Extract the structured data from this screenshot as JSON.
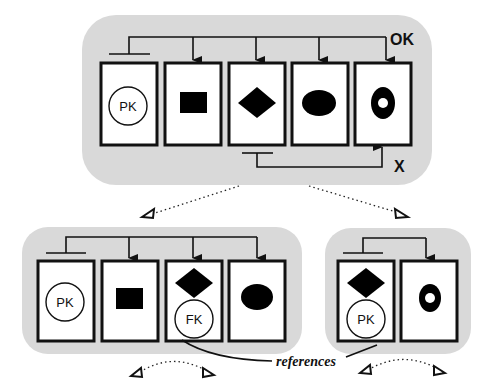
{
  "diagram": {
    "colors": {
      "panel": "#d9d9d9",
      "ink": "#111111",
      "card": "#ffffff"
    },
    "top_group": {
      "ok_label": "OK",
      "x_label": "X",
      "cards": [
        {
          "shape": "circle-key",
          "key": "PK"
        },
        {
          "shape": "rectangle"
        },
        {
          "shape": "diamond"
        },
        {
          "shape": "ellipse"
        },
        {
          "shape": "ring"
        }
      ]
    },
    "bottom_left_group": {
      "cards": [
        {
          "shape": "circle-key",
          "key": "PK"
        },
        {
          "shape": "rectangle"
        },
        {
          "shape": "diamond",
          "key": "FK"
        },
        {
          "shape": "ellipse"
        }
      ]
    },
    "bottom_right_group": {
      "cards": [
        {
          "shape": "diamond",
          "key": "PK"
        },
        {
          "shape": "ring"
        }
      ]
    },
    "references_label": "references"
  }
}
